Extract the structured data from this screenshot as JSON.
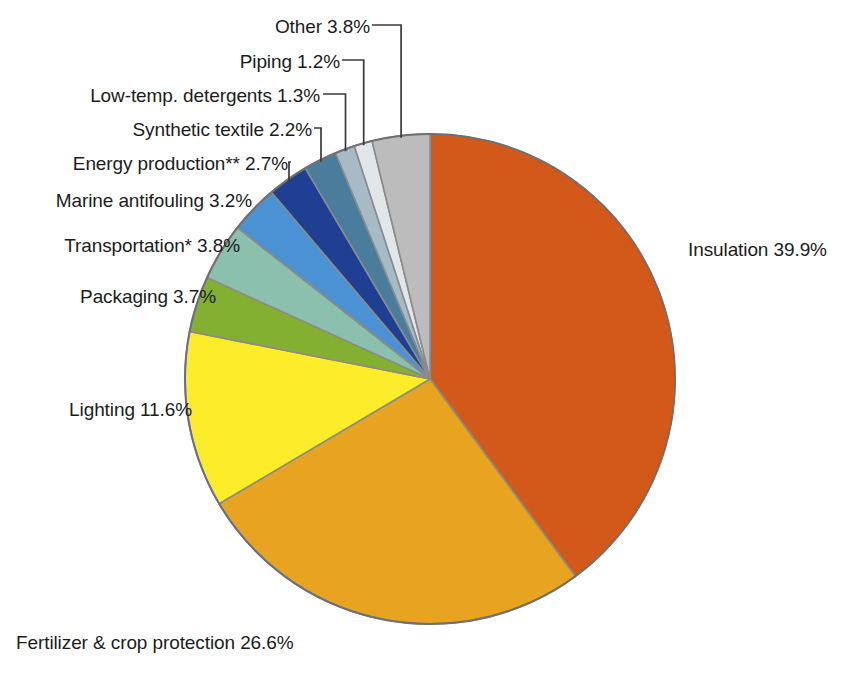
{
  "figure": {
    "background_color": "#ffffff",
    "cropped_title_fragment": "",
    "pie": {
      "center_x": 430,
      "center_y": 379,
      "radius": 245,
      "start_angle_deg": -90,
      "direction": "clockwise",
      "slice_stroke": "#8b8b8b",
      "outline": "#6f6f6f"
    }
  },
  "chart_data": {
    "type": "pie",
    "title": "",
    "xlabel": "",
    "ylabel": "",
    "units": "percent",
    "legend": "none, labels placed outside with leader lines",
    "grid": false,
    "categories": [
      "Insulation",
      "Fertilizer & crop protection",
      "Lighting",
      "Packaging",
      "Transportation*",
      "Marine antifouling",
      "Energy production**",
      "Synthetic textile",
      "Low-temp. detergents",
      "Piping",
      "Other"
    ],
    "values": [
      39.9,
      26.6,
      11.6,
      3.7,
      3.8,
      3.2,
      2.7,
      2.2,
      1.3,
      1.2,
      3.8
    ],
    "colors": [
      "#d2591a",
      "#e8a321",
      "#fdec2a",
      "#84b031",
      "#8bbfae",
      "#4b92d4",
      "#1f3f92",
      "#4a7d9b",
      "#a8bac6",
      "#e2e6e8",
      "#bcbcbc"
    ],
    "slices": [
      {
        "label": "Insulation",
        "value": 39.9,
        "display": "Insulation 39.9%",
        "color": "#d2591a"
      },
      {
        "label": "Fertilizer & crop protection",
        "value": 26.6,
        "display": "Fertilizer & crop protection 26.6%",
        "color": "#e8a321"
      },
      {
        "label": "Lighting",
        "value": 11.6,
        "display": "Lighting 11.6%",
        "color": "#fdec2a"
      },
      {
        "label": "Packaging",
        "value": 3.7,
        "display": "Packaging 3.7%",
        "color": "#84b031"
      },
      {
        "label": "Transportation*",
        "value": 3.8,
        "display": "Transportation* 3.8%",
        "color": "#8bbfae"
      },
      {
        "label": "Marine antifouling",
        "value": 3.2,
        "display": "Marine antifouling 3.2%",
        "color": "#4b92d4"
      },
      {
        "label": "Energy production**",
        "value": 2.7,
        "display": "Energy production** 2.7%",
        "color": "#1f3f92"
      },
      {
        "label": "Synthetic textile",
        "value": 2.2,
        "display": "Synthetic textile 2.2%",
        "color": "#4a7d9b"
      },
      {
        "label": "Low-temp. detergents",
        "value": 1.3,
        "display": "Low-temp. detergents 1.3%",
        "color": "#a8bac6"
      },
      {
        "label": "Piping",
        "value": 1.2,
        "display": "Piping 1.2%",
        "color": "#e2e6e8"
      },
      {
        "label": "Other",
        "value": 3.8,
        "display": "Other 3.8%",
        "color": "#bcbcbc"
      }
    ]
  },
  "labels": {
    "insulation": "Insulation 39.9%",
    "fertilizer": "Fertilizer & crop protection 26.6%",
    "lighting": "Lighting 11.6%",
    "packaging": "Packaging 3.7%",
    "transportation": "Transportation* 3.8%",
    "marine": "Marine antifouling 3.2%",
    "energy": "Energy production** 2.7%",
    "textile": "Synthetic textile 2.2%",
    "detergents": "Low-temp. detergents 1.3%",
    "piping": "Piping 1.2%",
    "other": "Other 3.8%"
  }
}
